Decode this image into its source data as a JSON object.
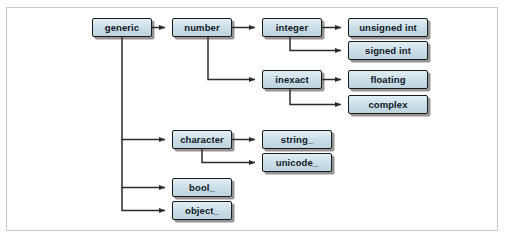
{
  "figure": {
    "background_color": "#ffffff",
    "frame_color": "#c9c9c9",
    "node_fill_color": "#cfe0e8",
    "node_border_color": "#1b1b1b",
    "connector_color": "#2b2b2b"
  },
  "nodes": [
    {
      "id": "generic",
      "label": "generic",
      "x": 92,
      "y": 18,
      "w": 60,
      "h": 19
    },
    {
      "id": "number",
      "label": "number",
      "x": 172,
      "y": 18,
      "w": 60,
      "h": 19
    },
    {
      "id": "integer",
      "label": "integer",
      "x": 262,
      "y": 18,
      "w": 60,
      "h": 19
    },
    {
      "id": "unsigned_int",
      "label": "unsigned int",
      "x": 348,
      "y": 18,
      "w": 80,
      "h": 19
    },
    {
      "id": "signed_int",
      "label": "signed int",
      "x": 348,
      "y": 41,
      "w": 80,
      "h": 19
    },
    {
      "id": "inexact",
      "label": "inexact",
      "x": 262,
      "y": 70,
      "w": 60,
      "h": 19
    },
    {
      "id": "floating",
      "label": "floating",
      "x": 348,
      "y": 70,
      "w": 80,
      "h": 19
    },
    {
      "id": "complex",
      "label": "complex",
      "x": 348,
      "y": 95,
      "w": 80,
      "h": 19
    },
    {
      "id": "character",
      "label": "character",
      "x": 172,
      "y": 130,
      "w": 60,
      "h": 19
    },
    {
      "id": "string",
      "label": "string_",
      "x": 262,
      "y": 130,
      "w": 70,
      "h": 19
    },
    {
      "id": "unicode",
      "label": "unicode_",
      "x": 262,
      "y": 153,
      "w": 70,
      "h": 19
    },
    {
      "id": "bool",
      "label": "bool_",
      "x": 172,
      "y": 178,
      "w": 60,
      "h": 19
    },
    {
      "id": "object",
      "label": "object_",
      "x": 172,
      "y": 201,
      "w": 60,
      "h": 19
    }
  ],
  "edges": [
    {
      "from": "generic",
      "to": "number"
    },
    {
      "from": "generic",
      "to": "character"
    },
    {
      "from": "generic",
      "to": "bool"
    },
    {
      "from": "generic",
      "to": "object"
    },
    {
      "from": "number",
      "to": "integer"
    },
    {
      "from": "number",
      "to": "inexact"
    },
    {
      "from": "integer",
      "to": "unsigned_int"
    },
    {
      "from": "integer",
      "to": "signed_int"
    },
    {
      "from": "inexact",
      "to": "floating"
    },
    {
      "from": "inexact",
      "to": "complex"
    },
    {
      "from": "character",
      "to": "string"
    },
    {
      "from": "character",
      "to": "unicode"
    }
  ]
}
